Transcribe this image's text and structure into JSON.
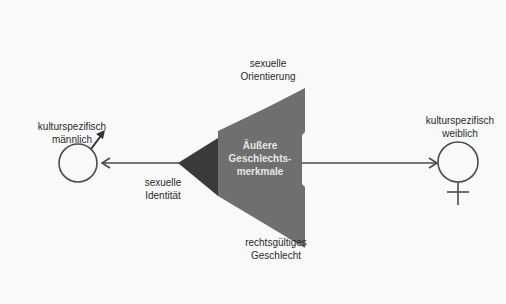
{
  "diagram": {
    "nodes": {
      "male": {
        "label_line1": "kulturspezifisch",
        "label_line2": "männlich",
        "icon": "male-symbol-icon"
      },
      "female": {
        "label_line1": "kulturspezifisch",
        "label_line2": "weiblich",
        "icon": "female-symbol-icon"
      },
      "center": {
        "label_line1": "Äußere",
        "label_line2": "Geschlechts-",
        "label_line3": "merkmale"
      }
    },
    "annotations": {
      "orientation": {
        "line1": "sexuelle",
        "line2": "Orientierung"
      },
      "identity": {
        "line1": "sexuelle",
        "line2": "Identität"
      },
      "legal": {
        "line1": "rechtsgültiges",
        "line2": "Geschlecht"
      }
    },
    "colors": {
      "background": "#f9f9f9",
      "line": "#4a4a4a",
      "triangle_main": "#6f6f6f",
      "triangle_dark": "#3a3a3a",
      "inner_text": "#e6e6e6"
    },
    "connector": "double-headed-arrow"
  }
}
